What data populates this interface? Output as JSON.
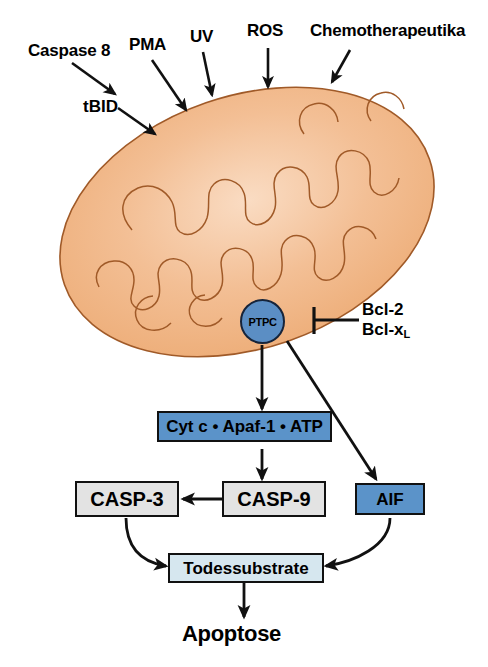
{
  "figure": {
    "background_color": "#ffffff"
  },
  "colors": {
    "mitochondrion_fill": "#f0b183",
    "mitochondrion_fill_light": "#fadcc3",
    "mitochondrion_outline": "#a05a28",
    "box_blue": "#5b93c9",
    "box_gray": "#e3e3e3",
    "box_pale_blue": "#d6e7ef",
    "ptpc_blue": "#5b8ec4",
    "stroke_black": "#111111"
  },
  "stimuli": [
    {
      "id": "caspase-8",
      "label": "Caspase 8"
    },
    {
      "id": "pma",
      "label": "PMA"
    },
    {
      "id": "uv",
      "label": "UV"
    },
    {
      "id": "ros",
      "label": "ROS"
    },
    {
      "id": "chemotherapeutika",
      "label": "Chemotherapeutika"
    }
  ],
  "intermediates": {
    "tbid": "tBID"
  },
  "organelle": {
    "name": "mitochondrion",
    "pore_label": "PTPC"
  },
  "inhibitors": {
    "line1": "Bcl-2",
    "line2_base": "Bcl-x",
    "line2_sub": "L"
  },
  "nodes": [
    {
      "id": "apoptosome",
      "label": "Cyt c • Apaf-1 • ATP",
      "style": "blue"
    },
    {
      "id": "casp9",
      "label": "CASP-9",
      "style": "gray"
    },
    {
      "id": "casp3",
      "label": "CASP-3",
      "style": "gray"
    },
    {
      "id": "aif",
      "label": "AIF",
      "style": "blue"
    },
    {
      "id": "todessubstrate",
      "label": "Todessubstrate",
      "style": "pale"
    }
  ],
  "outcome": {
    "label": "Apoptose"
  },
  "edges": [
    {
      "from": "caspase-8",
      "to": "tbid",
      "type": "arrow"
    },
    {
      "from": "tbid",
      "to": "mitochondrion",
      "type": "arrow"
    },
    {
      "from": "pma",
      "to": "mitochondrion",
      "type": "arrow"
    },
    {
      "from": "uv",
      "to": "mitochondrion",
      "type": "arrow"
    },
    {
      "from": "ros",
      "to": "mitochondrion",
      "type": "arrow"
    },
    {
      "from": "chemotherapeutika",
      "to": "mitochondrion",
      "type": "arrow"
    },
    {
      "from": "bcl",
      "to": "ptpc",
      "type": "inhibition"
    },
    {
      "from": "ptpc",
      "to": "apoptosome",
      "type": "arrow"
    },
    {
      "from": "ptpc",
      "to": "aif",
      "type": "arrow"
    },
    {
      "from": "apoptosome",
      "to": "casp9",
      "type": "arrow"
    },
    {
      "from": "casp9",
      "to": "casp3",
      "type": "arrow"
    },
    {
      "from": "casp3",
      "to": "todessubstrate",
      "type": "curved-arrow"
    },
    {
      "from": "aif",
      "to": "todessubstrate",
      "type": "curved-arrow"
    },
    {
      "from": "todessubstrate",
      "to": "apoptose",
      "type": "arrow"
    }
  ]
}
